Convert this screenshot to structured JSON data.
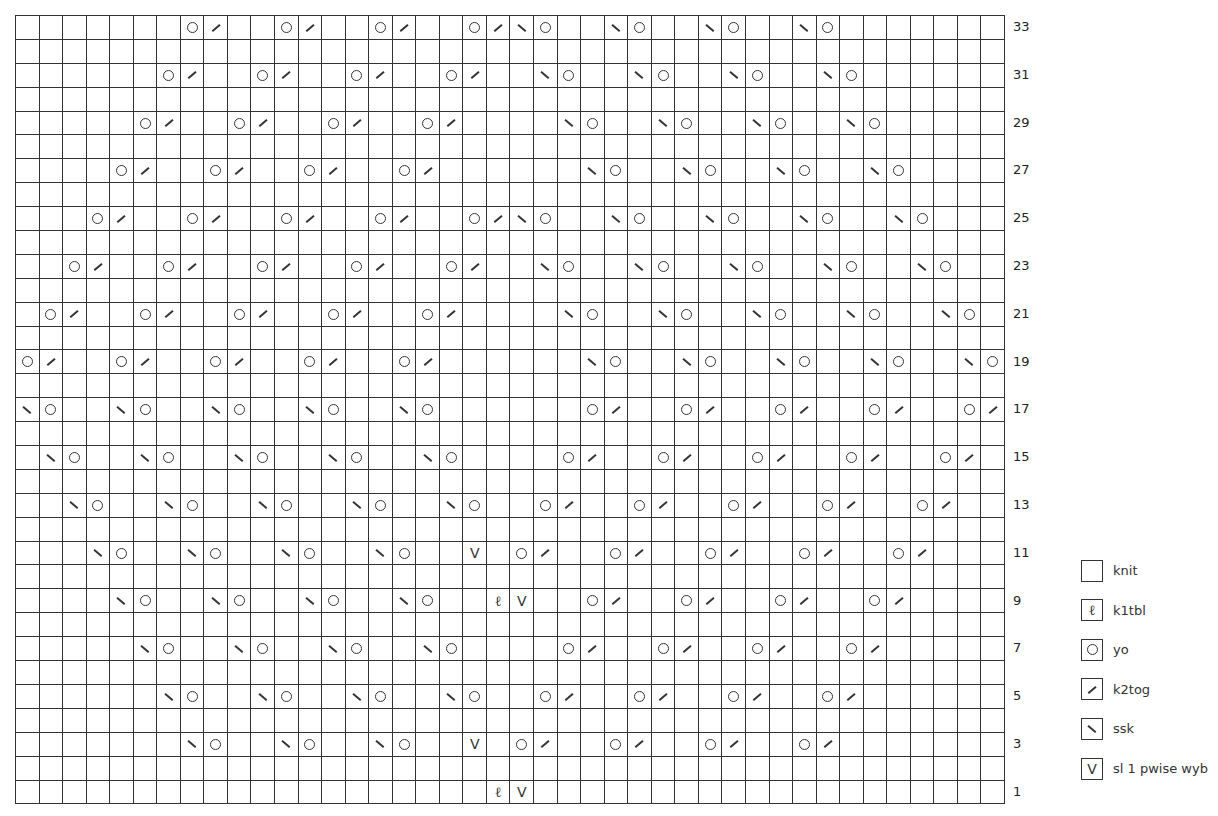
{
  "chart": {
    "columns": 42,
    "symbol_key": {
      ".": "knit",
      "q": "k1tbl",
      "o": "yo",
      "/": "k2tog",
      "\\": "ssk",
      "v": "sl1-pwise-wyb"
    },
    "rows": [
      {
        "number": 33,
        "label": "33",
        "cells": ".......o/..o/..o/..o/\\o..\\o..\\o..\\o......."
      },
      {
        "number": 32,
        "label": "",
        "cells": ".........................................."
      },
      {
        "number": 31,
        "label": "31",
        "cells": "......o/..o/..o/..o/..\\o..\\o..\\o..\\o......"
      },
      {
        "number": 30,
        "label": "",
        "cells": ".........................................."
      },
      {
        "number": 29,
        "label": "29",
        "cells": ".....o/..o/..o/..o/....\\o..\\o..\\o..\\o....."
      },
      {
        "number": 28,
        "label": "",
        "cells": ".........................................."
      },
      {
        "number": 27,
        "label": "27",
        "cells": "....o/..o/..o/..o/......\\o..\\o..\\o..\\o...."
      },
      {
        "number": 26,
        "label": "",
        "cells": ".........................................."
      },
      {
        "number": 25,
        "label": "25",
        "cells": "...o/..o/..o/..o/..o/\\o..\\o..\\o..\\o..\\o..."
      },
      {
        "number": 24,
        "label": "",
        "cells": ".........................................."
      },
      {
        "number": 23,
        "label": "23",
        "cells": "..o/..o/..o/..o/..o/..\\o..\\o..\\o..\\o..\\o.."
      },
      {
        "number": 22,
        "label": "",
        "cells": ".........................................."
      },
      {
        "number": 21,
        "label": "21",
        "cells": ".o/..o/..o/..o/..o/....\\o..\\o..\\o..\\o..\\o."
      },
      {
        "number": 20,
        "label": "",
        "cells": ".........................................."
      },
      {
        "number": 19,
        "label": "19",
        "cells": "o/..o/..o/..o/..o/......\\o..\\o..\\o..\\o..\\o"
      },
      {
        "number": 18,
        "label": "",
        "cells": ".........................................."
      },
      {
        "number": 17,
        "label": "17",
        "cells": "\\o..\\o..\\o..\\o..\\o......o/..o/..o/..o/..o/"
      },
      {
        "number": 16,
        "label": "",
        "cells": ".........................................."
      },
      {
        "number": 15,
        "label": "15",
        "cells": ".\\o..\\o..\\o..\\o..\\o....o/..o/..o/..o/..o/."
      },
      {
        "number": 14,
        "label": "",
        "cells": ".........................................."
      },
      {
        "number": 13,
        "label": "13",
        "cells": "..\\o..\\o..\\o..\\o..\\o..o/..o/..o/..o/..o/.."
      },
      {
        "number": 12,
        "label": "",
        "cells": ".........................................."
      },
      {
        "number": 11,
        "label": "11",
        "cells": "...\\o..\\o..\\o..\\o..v.o/..o/..o/..o/..o/..."
      },
      {
        "number": 10,
        "label": "",
        "cells": ".........................................."
      },
      {
        "number": 9,
        "label": "9",
        "cells": "....\\o..\\o..\\o..\\o..qv..o/..o/..o/..o/...."
      },
      {
        "number": 8,
        "label": "",
        "cells": ".........................................."
      },
      {
        "number": 7,
        "label": "7",
        "cells": ".....\\o..\\o..\\o..\\o....o/..o/..o/..o/....."
      },
      {
        "number": 6,
        "label": "",
        "cells": ".........................................."
      },
      {
        "number": 5,
        "label": "5",
        "cells": "......\\o..\\o..\\o..\\o..o/..o/..o/..o/......"
      },
      {
        "number": 4,
        "label": "",
        "cells": ".........................................."
      },
      {
        "number": 3,
        "label": "3",
        "cells": ".......\\o..\\o..\\o..v.o/..o/..o/..o/......."
      },
      {
        "number": 2,
        "label": "",
        "cells": ".........................................."
      },
      {
        "number": 1,
        "label": "1",
        "cells": "....................qv...................."
      }
    ]
  },
  "legend": {
    "items": [
      {
        "symbol": ".",
        "label": "knit"
      },
      {
        "symbol": "q",
        "label": "k1tbl"
      },
      {
        "symbol": "o",
        "label": "yo"
      },
      {
        "symbol": "/",
        "label": "k2tog"
      },
      {
        "symbol": "\\",
        "label": "ssk"
      },
      {
        "symbol": "v",
        "label": "sl 1 pwise wyb"
      }
    ]
  },
  "glyphs": {
    "k1tbl": "ℓ",
    "sl": "V"
  }
}
